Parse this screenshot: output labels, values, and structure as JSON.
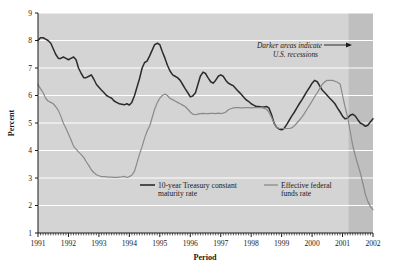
{
  "chart_data": {
    "type": "line",
    "title": "",
    "xlabel": "Period",
    "ylabel": "Percent",
    "ylim": [
      1,
      9
    ],
    "xlim": [
      1991,
      2002
    ],
    "grid": true,
    "grid_color": "#ffffff",
    "plot_background": "#d4d4d4",
    "legend_position": "inside-bottom-center",
    "y_ticks": [
      "9",
      "8",
      "7",
      "6",
      "5",
      "4",
      "3",
      "2",
      "1"
    ],
    "x_ticks": [
      "1991",
      "1992",
      "1993",
      "1994",
      "1995",
      "1996",
      "1997",
      "1998",
      "1999",
      "2000",
      "2001",
      "2002"
    ],
    "x_minor_ticks_per_year": 12,
    "annotations": [
      {
        "text_line_1": "Darker areas indicate",
        "text_line_2": "U.S. recessions",
        "arrow": "right-arrow",
        "style": "italic"
      }
    ],
    "shaded_regions": [
      {
        "name": "us-recession-2001",
        "start": 2001.2,
        "end": 2002.08,
        "color": "#bfbfbf",
        "label": "U.S. recession"
      }
    ],
    "series": [
      {
        "name": "10-year Treasury constant maturity rate",
        "legend_line_1": "10-year Treasury constant",
        "legend_line_2": "maturity rate",
        "color": "#2b2b2b",
        "width": 1.5,
        "x": [
          1991.0,
          1991.08,
          1991.17,
          1991.25,
          1991.33,
          1991.42,
          1991.5,
          1991.58,
          1991.67,
          1991.75,
          1991.83,
          1991.92,
          1992.0,
          1992.08,
          1992.17,
          1992.25,
          1992.33,
          1992.42,
          1992.5,
          1992.58,
          1992.67,
          1992.75,
          1992.83,
          1992.92,
          1993.0,
          1993.08,
          1993.17,
          1993.25,
          1993.33,
          1993.42,
          1993.5,
          1993.58,
          1993.67,
          1993.75,
          1993.83,
          1993.92,
          1994.0,
          1994.08,
          1994.17,
          1994.25,
          1994.33,
          1994.42,
          1994.5,
          1994.58,
          1994.67,
          1994.75,
          1994.83,
          1994.92,
          1995.0,
          1995.08,
          1995.17,
          1995.25,
          1995.33,
          1995.42,
          1995.5,
          1995.58,
          1995.67,
          1995.75,
          1995.83,
          1995.92,
          1996.0,
          1996.08,
          1996.17,
          1996.25,
          1996.33,
          1996.42,
          1996.5,
          1996.58,
          1996.67,
          1996.75,
          1996.83,
          1996.92,
          1997.0,
          1997.08,
          1997.17,
          1997.25,
          1997.33,
          1997.42,
          1997.5,
          1997.58,
          1997.67,
          1997.75,
          1997.83,
          1997.92,
          1998.0,
          1998.08,
          1998.17,
          1998.25,
          1998.33,
          1998.42,
          1998.5,
          1998.58,
          1998.67,
          1998.75,
          1998.83,
          1998.92,
          1999.0,
          1999.08,
          1999.17,
          1999.25,
          1999.33,
          1999.42,
          1999.5,
          1999.58,
          1999.67,
          1999.75,
          1999.83,
          1999.92,
          2000.0,
          2000.08,
          2000.17,
          2000.25,
          2000.33,
          2000.42,
          2000.5,
          2000.58,
          2000.67,
          2000.75,
          2000.83,
          2000.92,
          2001.0,
          2001.08,
          2001.17,
          2001.25,
          2001.33,
          2001.42,
          2001.5,
          2001.58,
          2001.67,
          2001.75,
          2001.83,
          2001.92,
          2002.0
        ],
        "values": [
          8.0,
          8.1,
          8.1,
          8.05,
          8.0,
          7.9,
          7.7,
          7.5,
          7.35,
          7.35,
          7.4,
          7.35,
          7.3,
          7.35,
          7.4,
          7.3,
          7.0,
          6.8,
          6.65,
          6.65,
          6.7,
          6.75,
          6.6,
          6.4,
          6.3,
          6.2,
          6.1,
          6.0,
          5.95,
          5.9,
          5.8,
          5.75,
          5.7,
          5.68,
          5.66,
          5.7,
          5.65,
          5.75,
          6.0,
          6.3,
          6.6,
          7.0,
          7.2,
          7.25,
          7.45,
          7.65,
          7.85,
          7.9,
          7.85,
          7.6,
          7.35,
          7.1,
          6.9,
          6.75,
          6.7,
          6.65,
          6.55,
          6.4,
          6.25,
          6.1,
          5.95,
          5.98,
          6.1,
          6.4,
          6.7,
          6.85,
          6.8,
          6.65,
          6.5,
          6.45,
          6.55,
          6.7,
          6.75,
          6.7,
          6.55,
          6.45,
          6.4,
          6.35,
          6.25,
          6.15,
          6.05,
          5.95,
          5.85,
          5.78,
          5.7,
          5.65,
          5.6,
          5.6,
          5.58,
          5.58,
          5.6,
          5.55,
          5.3,
          5.0,
          4.85,
          4.78,
          4.75,
          4.8,
          4.95,
          5.1,
          5.25,
          5.4,
          5.55,
          5.7,
          5.85,
          6.0,
          6.15,
          6.3,
          6.45,
          6.55,
          6.5,
          6.35,
          6.2,
          6.1,
          6.0,
          5.9,
          5.8,
          5.7,
          5.55,
          5.4,
          5.25,
          5.15,
          5.18,
          5.28,
          5.32,
          5.25,
          5.12,
          5.0,
          4.95,
          4.88,
          4.92,
          5.05,
          5.15
        ],
        "start_value": 8.0,
        "end_value": 5.15,
        "min_value": 4.75,
        "max_value": 8.1
      },
      {
        "name": "Effective federal funds rate",
        "legend_line_1": "Effective federal",
        "legend_line_2": "funds rate",
        "color": "#8a8a8a",
        "width": 1.2,
        "x": [
          1991.0,
          1991.08,
          1991.17,
          1991.25,
          1991.33,
          1991.42,
          1991.5,
          1991.58,
          1991.67,
          1991.75,
          1991.83,
          1991.92,
          1992.0,
          1992.08,
          1992.17,
          1992.25,
          1992.33,
          1992.42,
          1992.5,
          1992.58,
          1992.67,
          1992.75,
          1992.83,
          1992.92,
          1993.0,
          1993.08,
          1993.17,
          1993.25,
          1993.33,
          1993.42,
          1993.5,
          1993.58,
          1993.67,
          1993.75,
          1993.83,
          1993.92,
          1994.0,
          1994.08,
          1994.17,
          1994.25,
          1994.33,
          1994.42,
          1994.5,
          1994.58,
          1994.67,
          1994.75,
          1994.83,
          1994.92,
          1995.0,
          1995.08,
          1995.17,
          1995.25,
          1995.33,
          1995.42,
          1995.5,
          1995.58,
          1995.67,
          1995.75,
          1995.83,
          1995.92,
          1996.0,
          1996.08,
          1996.17,
          1996.25,
          1996.33,
          1996.42,
          1996.5,
          1996.58,
          1996.67,
          1996.75,
          1996.83,
          1996.92,
          1997.0,
          1997.08,
          1997.17,
          1997.25,
          1997.33,
          1997.42,
          1997.5,
          1997.58,
          1997.67,
          1997.75,
          1997.83,
          1997.92,
          1998.0,
          1998.08,
          1998.17,
          1998.25,
          1998.33,
          1998.42,
          1998.5,
          1998.58,
          1998.67,
          1998.75,
          1998.83,
          1998.92,
          1999.0,
          1999.08,
          1999.17,
          1999.25,
          1999.33,
          1999.42,
          1999.5,
          1999.58,
          1999.67,
          1999.75,
          1999.83,
          1999.92,
          2000.0,
          2000.08,
          2000.17,
          2000.25,
          2000.33,
          2000.42,
          2000.5,
          2000.58,
          2000.67,
          2000.75,
          2000.83,
          2000.92,
          2001.0,
          2001.08,
          2001.17,
          2001.25,
          2001.33,
          2001.42,
          2001.5,
          2001.58,
          2001.67,
          2001.75,
          2001.83,
          2001.92,
          2002.0
        ],
        "values": [
          6.4,
          6.25,
          6.1,
          5.9,
          5.8,
          5.75,
          5.7,
          5.6,
          5.45,
          5.25,
          5.0,
          4.8,
          4.6,
          4.4,
          4.15,
          4.05,
          3.95,
          3.85,
          3.75,
          3.6,
          3.45,
          3.3,
          3.2,
          3.12,
          3.08,
          3.05,
          3.05,
          3.04,
          3.03,
          3.03,
          3.02,
          3.02,
          3.03,
          3.04,
          3.06,
          3.02,
          3.05,
          3.1,
          3.25,
          3.55,
          3.85,
          4.15,
          4.45,
          4.7,
          4.9,
          5.2,
          5.5,
          5.75,
          5.9,
          6.0,
          6.05,
          6.0,
          5.9,
          5.85,
          5.8,
          5.75,
          5.7,
          5.65,
          5.6,
          5.5,
          5.4,
          5.32,
          5.3,
          5.32,
          5.34,
          5.35,
          5.34,
          5.34,
          5.35,
          5.35,
          5.34,
          5.36,
          5.34,
          5.36,
          5.4,
          5.48,
          5.52,
          5.55,
          5.56,
          5.56,
          5.55,
          5.55,
          5.56,
          5.56,
          5.55,
          5.56,
          5.56,
          5.56,
          5.56,
          5.54,
          5.5,
          5.4,
          5.2,
          5.0,
          4.85,
          4.8,
          4.8,
          4.8,
          4.8,
          4.8,
          4.82,
          4.9,
          5.0,
          5.1,
          5.22,
          5.35,
          5.5,
          5.65,
          5.8,
          5.95,
          6.1,
          6.25,
          6.4,
          6.5,
          6.55,
          6.55,
          6.55,
          6.52,
          6.48,
          6.42,
          6.0,
          5.6,
          5.2,
          4.7,
          4.2,
          3.8,
          3.5,
          3.2,
          2.8,
          2.4,
          2.15,
          1.95,
          1.85
        ],
        "start_value": 6.4,
        "end_value": 1.85,
        "min_value": 1.85,
        "max_value": 6.55
      }
    ]
  }
}
